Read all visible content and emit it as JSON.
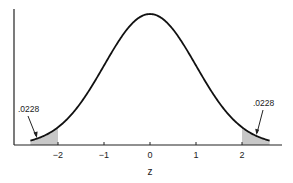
{
  "chart_data": {
    "type": "area",
    "title": "",
    "xlabel": "z",
    "ylabel": "",
    "xlim": [
      -2.9,
      3.1
    ],
    "x_ticks": [
      -2,
      -1,
      0,
      1,
      2
    ],
    "x_tick_labels": [
      "−2",
      "−1",
      "0",
      "1",
      "2"
    ],
    "grid": false,
    "legend": null,
    "series": [
      {
        "name": "standard normal density",
        "distribution": "normal",
        "mean": 0,
        "sd": 1,
        "x_range": [
          -2.6,
          2.6
        ]
      }
    ],
    "shaded_regions": [
      {
        "name": "left tail",
        "from": -2.6,
        "to": -2,
        "area_label": ".0228",
        "color": "#c8c8c8"
      },
      {
        "name": "right tail",
        "from": 2,
        "to": 2.6,
        "area_label": ".0228",
        "color": "#c8c8c8"
      }
    ],
    "annotations": [
      {
        "text": ".0228",
        "points_to_x": -2.3,
        "side": "left"
      },
      {
        "text": ".0228",
        "points_to_x": 2.3,
        "side": "right"
      }
    ]
  },
  "labels": {
    "x_axis": "z",
    "ticks": [
      "−2",
      "−1",
      "0",
      "1",
      "2"
    ],
    "left_annotation": ".0228",
    "right_annotation": ".0228"
  }
}
